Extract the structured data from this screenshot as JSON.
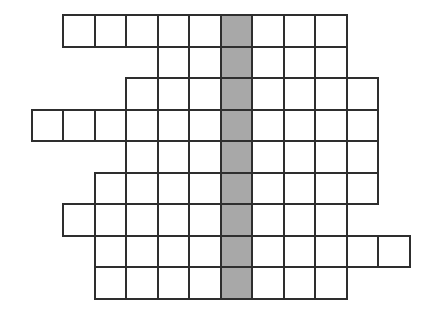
{
  "puzzle": {
    "kind": "crossword-grid",
    "title": "Blank crossword puzzle grid",
    "geometry": {
      "cell_size": 31.5,
      "origin_x": 62,
      "origin_y": 14,
      "border_width": 2,
      "rows": 9,
      "grid_columns": 13
    },
    "colors": {
      "cell_fill": "#ffffff",
      "cell_border": "#2e2e2e",
      "highlight_fill": "#a8a8a8",
      "page_background": "#ffffff"
    },
    "highlight": {
      "type": "column",
      "column_index": 5,
      "label": "shaded-answer-column",
      "cell_count": 9
    },
    "rows": [
      {
        "index": 0,
        "start_col": 0,
        "length": 9,
        "shaded_cols": [
          5
        ]
      },
      {
        "index": 1,
        "start_col": 3,
        "length": 6,
        "shaded_cols": [
          5
        ]
      },
      {
        "index": 2,
        "start_col": 2,
        "length": 8,
        "shaded_cols": [
          5
        ]
      },
      {
        "index": 3,
        "start_col": -1,
        "length": 11,
        "shaded_cols": [
          5
        ]
      },
      {
        "index": 4,
        "start_col": 2,
        "length": 8,
        "shaded_cols": [
          5
        ]
      },
      {
        "index": 5,
        "start_col": 1,
        "length": 9,
        "shaded_cols": [
          5
        ]
      },
      {
        "index": 6,
        "start_col": 0,
        "length": 9,
        "shaded_cols": [
          5
        ]
      },
      {
        "index": 7,
        "start_col": 1,
        "length": 10,
        "shaded_cols": [
          5
        ]
      },
      {
        "index": 8,
        "start_col": 1,
        "length": 8,
        "shaded_cols": [
          5
        ]
      }
    ]
  }
}
